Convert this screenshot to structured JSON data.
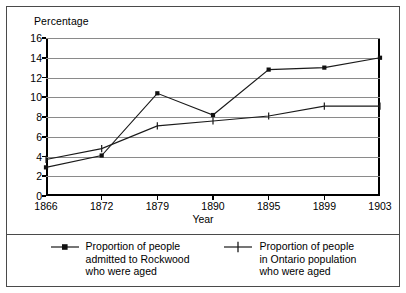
{
  "axes": {
    "y_title": "Percentage",
    "x_title": "Year",
    "y_ticks": [
      "16",
      "14",
      "12",
      "10",
      "8",
      "6",
      "4",
      "2",
      "0"
    ],
    "x_ticks": [
      "1866",
      "1872",
      "1879",
      "1890",
      "1895",
      "1899",
      "1903"
    ]
  },
  "legend": {
    "entries": [
      {
        "marker": "square-marker-icon",
        "label": "Proportion of people\nadmitted to Rockwood\nwho were aged"
      },
      {
        "marker": "plus-marker-icon",
        "label": "Proportion of people\nin Ontario population\nwho were aged"
      }
    ]
  },
  "colors": {
    "line": "#1a1a1a",
    "grid": "#8a8a8a",
    "axis": "#000000",
    "frame": "#4a4a4a",
    "background": "#ffffff"
  },
  "chart_data": {
    "type": "line",
    "title": "",
    "xlabel": "Year",
    "ylabel": "Percentage",
    "x": [
      "1866",
      "1872",
      "1879",
      "1890",
      "1895",
      "1899",
      "1903"
    ],
    "ylim": [
      0,
      16
    ],
    "ytick_step": 2,
    "grid": true,
    "legend_position": "bottom",
    "series": [
      {
        "name": "Proportion of people admitted to Rockwood who were aged",
        "marker": "square",
        "values": [
          2.9,
          4.1,
          10.4,
          8.2,
          12.8,
          13.0,
          14.0
        ]
      },
      {
        "name": "Proportion of people in Ontario population who were aged",
        "marker": "plus",
        "values": [
          3.7,
          4.8,
          7.1,
          7.6,
          8.1,
          9.1,
          9.1
        ]
      }
    ]
  }
}
